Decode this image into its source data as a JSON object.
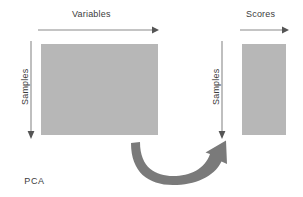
{
  "diagram": {
    "colors": {
      "matrix_fill": "#b7b7b7",
      "arrow_thin": "#8a8a8a",
      "arrow_curved": "#7a7a7a",
      "text": "#3c3c3c",
      "background": "#ffffff"
    },
    "blocks": [
      {
        "id": "data-matrix",
        "name": "data-matrix",
        "top_axis_label": "Variables",
        "side_axis_label": "Samples"
      },
      {
        "id": "scores-matrix",
        "name": "scores-matrix",
        "top_axis_label": "Scores",
        "side_axis_label": "Samples"
      }
    ],
    "labels": {
      "variables": "Variables",
      "scores": "Scores",
      "samples_left": "Samples",
      "samples_right": "Samples",
      "transform": "PCA"
    },
    "arrows": {
      "variables_arrow": "horizontal-right-arrow",
      "scores_arrow": "horizontal-right-arrow",
      "samples_left_arrow": "vertical-down-arrow",
      "samples_right_arrow": "vertical-down-arrow",
      "pca_arrow": "curved-u-arrow-up-right"
    }
  }
}
